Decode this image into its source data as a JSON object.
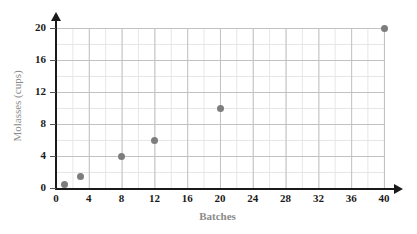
{
  "chart_data": {
    "type": "scatter",
    "title": "",
    "xlabel": "Batches",
    "ylabel": "Molasses (cups)",
    "xlim": [
      0,
      40
    ],
    "ylim": [
      0,
      20
    ],
    "x_ticks": [
      0,
      4,
      8,
      12,
      16,
      20,
      24,
      28,
      32,
      36,
      40
    ],
    "y_ticks": [
      0,
      4,
      8,
      12,
      16,
      20
    ],
    "x_tick_labels": [
      "0",
      "4",
      "8",
      "12",
      "16",
      "20",
      "24",
      "28",
      "32",
      "36",
      "40"
    ],
    "y_tick_labels": [
      "0",
      "4",
      "8",
      "12",
      "16",
      "20"
    ],
    "grid": true,
    "minor_grid": true,
    "x_minor_step": 2,
    "y_minor_step": 2,
    "legend": null,
    "points": [
      {
        "x": 1,
        "y": 0.5
      },
      {
        "x": 3,
        "y": 1.5
      },
      {
        "x": 8,
        "y": 4
      },
      {
        "x": 12,
        "y": 6
      },
      {
        "x": 20,
        "y": 10
      },
      {
        "x": 40,
        "y": 20
      }
    ],
    "point_color": "#7d7d7d",
    "axis_color": "#1a1a1a",
    "grid_major_color": "#c2c2c2",
    "grid_minor_color": "#e6e6e6",
    "axis_title_color": "#8a8a8a",
    "background": "#ffffff"
  }
}
